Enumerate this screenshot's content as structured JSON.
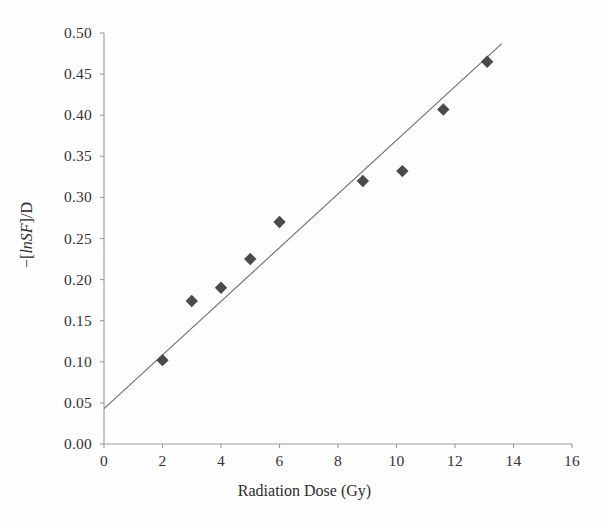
{
  "chart_data": {
    "type": "scatter",
    "title": "",
    "xlabel": "Radiation Dose (Gy)",
    "ylabel_parts": {
      "prefix": "−[",
      "italic": "lnSF",
      "suffix": "]/D"
    },
    "ylabel": "−[lnSF]/D",
    "xlim": [
      0,
      16
    ],
    "ylim": [
      0,
      0.5
    ],
    "xticks": [
      "0",
      "2",
      "4",
      "6",
      "8",
      "10",
      "12",
      "14",
      "16"
    ],
    "xtick_values": [
      0,
      2,
      4,
      6,
      8,
      10,
      12,
      14,
      16
    ],
    "yticks": [
      "0.00",
      "0.05",
      "0.10",
      "0.15",
      "0.20",
      "0.25",
      "0.30",
      "0.35",
      "0.40",
      "0.45",
      "0.50"
    ],
    "ytick_values": [
      0.0,
      0.05,
      0.1,
      0.15,
      0.2,
      0.25,
      0.3,
      0.35,
      0.4,
      0.45,
      0.5
    ],
    "grid": false,
    "legend": null,
    "marker": "diamond",
    "marker_color": "#4a4a4a",
    "line_color": "#6b6b6b",
    "axis_color": "#9a9a9a",
    "series": [
      {
        "name": "-[lnSF]/D vs dose",
        "points": [
          {
            "x": 2.0,
            "y": 0.102
          },
          {
            "x": 3.0,
            "y": 0.174
          },
          {
            "x": 4.0,
            "y": 0.19
          },
          {
            "x": 5.0,
            "y": 0.225
          },
          {
            "x": 6.0,
            "y": 0.27
          },
          {
            "x": 8.85,
            "y": 0.32
          },
          {
            "x": 10.2,
            "y": 0.332
          },
          {
            "x": 11.6,
            "y": 0.407
          },
          {
            "x": 13.1,
            "y": 0.465
          }
        ]
      }
    ],
    "fit_line": {
      "name": "linear trend",
      "x_start": 0.0,
      "y_start": 0.043,
      "x_end": 13.6,
      "y_end": 0.487
    }
  }
}
